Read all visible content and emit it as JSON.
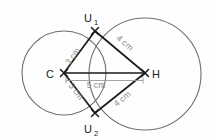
{
  "diagram": {
    "background_color": "#ffffff",
    "circle_color": "#6f6f6f",
    "edge_color": "#1a1a1a",
    "dimension_color": "#8a8a8a",
    "points": [
      {
        "id": "C",
        "label": "C",
        "sub": "",
        "x": 64,
        "y": 73,
        "label_x": 50,
        "label_y": 77
      },
      {
        "id": "H",
        "label": "H",
        "sub": "",
        "x": 145,
        "y": 73,
        "label_x": 152,
        "label_y": 77
      },
      {
        "id": "U1",
        "label": "U",
        "sub": "1",
        "x": 95,
        "y": 31,
        "label_x": 86,
        "label_y": 24
      },
      {
        "id": "U2",
        "label": "U",
        "sub": "2",
        "x": 95,
        "y": 113,
        "label_x": 86,
        "label_y": 133
      }
    ],
    "circles": [
      {
        "id": "circle-C",
        "center": "C",
        "cx": 64,
        "cy": 73,
        "r": 42
      },
      {
        "id": "circle-H",
        "center": "H",
        "cx": 145,
        "cy": 74,
        "r": 56
      }
    ],
    "segments": [
      {
        "id": "seg-C-U1",
        "from": "C",
        "to": "U1",
        "length_label": "3 cm"
      },
      {
        "id": "seg-U1-H",
        "from": "U1",
        "to": "H",
        "length_label": "4 cm"
      },
      {
        "id": "seg-C-U2",
        "from": "C",
        "to": "U2",
        "length_label": "3 cm"
      },
      {
        "id": "seg-U2-H",
        "from": "U2",
        "to": "H",
        "length_label": "4 cm"
      },
      {
        "id": "seg-C-H",
        "from": "C",
        "to": "H",
        "length_label": "5 cm"
      }
    ],
    "labels": {
      "len_c_u1": "3 cm",
      "len_u1_h": "4 cm",
      "len_c_u2": "3 cm",
      "len_u2_h": "4 cm",
      "len_c_h": "5 cm",
      "pt_c": "C",
      "pt_h": "H",
      "pt_u": "U",
      "sub_1": "1",
      "sub_2": "2"
    }
  }
}
